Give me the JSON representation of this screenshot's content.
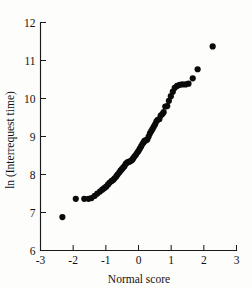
{
  "chart_data": {
    "type": "scatter",
    "title": "",
    "xlabel": "Normal score",
    "ylabel": "ln (Interrequest time)",
    "xlim": [
      -3,
      3
    ],
    "ylim": [
      6,
      12
    ],
    "xticks": [
      -3,
      -2,
      -1,
      0,
      1,
      2,
      3
    ],
    "xtick_labels": [
      "-3",
      "-2",
      "-1",
      "0",
      "1",
      "2",
      "3"
    ],
    "yticks": [
      6,
      7,
      8,
      9,
      10,
      11,
      12
    ],
    "ytick_labels": [
      "6",
      "7",
      "8",
      "9",
      "10",
      "11",
      "12"
    ],
    "grid": false,
    "legend": null,
    "marker": "filled-circle",
    "marker_color": "#0a0a0a",
    "marker_size": 3.1,
    "series": [
      {
        "name": "Interrequest time normal probability plot",
        "points": [
          [
            -2.33,
            6.88
          ],
          [
            -1.92,
            7.36
          ],
          [
            -1.66,
            7.36
          ],
          [
            -1.53,
            7.36
          ],
          [
            -1.44,
            7.38
          ],
          [
            -1.34,
            7.44
          ],
          [
            -1.26,
            7.5
          ],
          [
            -1.18,
            7.55
          ],
          [
            -1.11,
            7.6
          ],
          [
            -1.05,
            7.64
          ],
          [
            -0.99,
            7.68
          ],
          [
            -0.93,
            7.74
          ],
          [
            -0.88,
            7.79
          ],
          [
            -0.82,
            7.83
          ],
          [
            -0.77,
            7.86
          ],
          [
            -0.73,
            7.9
          ],
          [
            -0.68,
            7.95
          ],
          [
            -0.64,
            8.0
          ],
          [
            -0.59,
            8.05
          ],
          [
            -0.55,
            8.1
          ],
          [
            -0.51,
            8.14
          ],
          [
            -0.47,
            8.18
          ],
          [
            -0.43,
            8.22
          ],
          [
            -0.39,
            8.28
          ],
          [
            -0.35,
            8.31
          ],
          [
            -0.31,
            8.33
          ],
          [
            -0.27,
            8.34
          ],
          [
            -0.23,
            8.36
          ],
          [
            -0.19,
            8.39
          ],
          [
            -0.16,
            8.43
          ],
          [
            -0.12,
            8.48
          ],
          [
            -0.08,
            8.52
          ],
          [
            -0.04,
            8.57
          ],
          [
            0.0,
            8.62
          ],
          [
            0.04,
            8.68
          ],
          [
            0.08,
            8.74
          ],
          [
            0.12,
            8.8
          ],
          [
            0.16,
            8.85
          ],
          [
            0.19,
            8.89
          ],
          [
            0.23,
            8.9
          ],
          [
            0.27,
            8.92
          ],
          [
            0.31,
            9.0
          ],
          [
            0.35,
            9.08
          ],
          [
            0.39,
            9.14
          ],
          [
            0.43,
            9.2
          ],
          [
            0.47,
            9.26
          ],
          [
            0.51,
            9.32
          ],
          [
            0.55,
            9.4
          ],
          [
            0.59,
            9.44
          ],
          [
            0.64,
            9.46
          ],
          [
            0.68,
            9.55
          ],
          [
            0.73,
            9.59
          ],
          [
            0.77,
            9.64
          ],
          [
            0.82,
            9.79
          ],
          [
            0.88,
            9.8
          ],
          [
            0.93,
            9.94
          ],
          [
            0.99,
            10.06
          ],
          [
            1.05,
            10.18
          ],
          [
            1.11,
            10.28
          ],
          [
            1.18,
            10.33
          ],
          [
            1.26,
            10.36
          ],
          [
            1.34,
            10.37
          ],
          [
            1.44,
            10.37
          ],
          [
            1.53,
            10.39
          ],
          [
            1.66,
            10.53
          ],
          [
            1.81,
            10.77
          ],
          [
            2.27,
            11.37
          ]
        ]
      }
    ]
  },
  "axes": {
    "x_axis_name": "normal-score-axis",
    "y_axis_name": "ln-interrequest-time-axis"
  }
}
